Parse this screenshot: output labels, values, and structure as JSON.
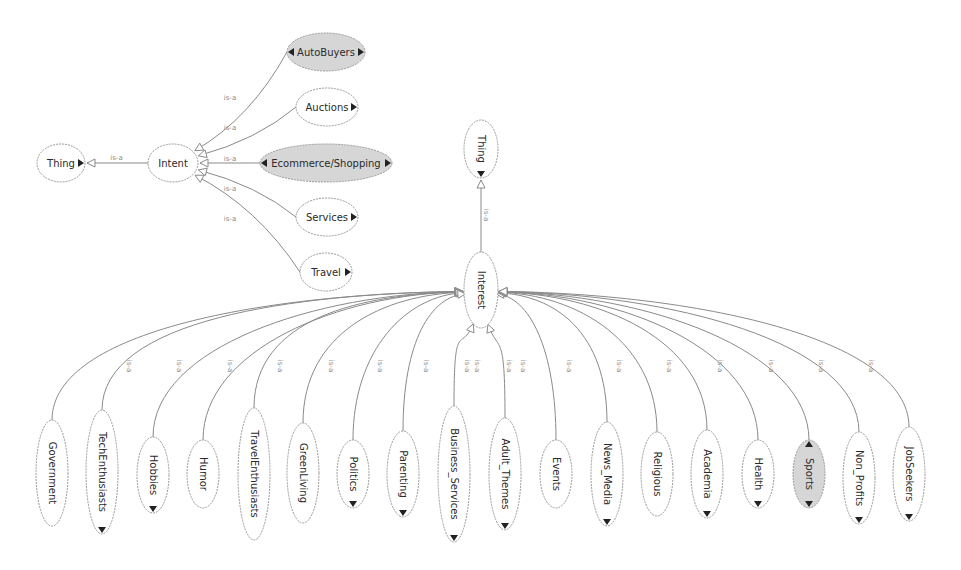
{
  "diagram": {
    "type": "ontology-graph",
    "edge_label": "is-a",
    "colors": {
      "background": "#ffffff",
      "node_fill": "#ffffff",
      "node_fill_selected": "#d6d6d6",
      "node_stroke": "#9a9a9a",
      "edge": "#8a8a8a",
      "text": "#2a2a2a"
    },
    "intent_cluster": {
      "root": {
        "label": "Thing",
        "cx": 61,
        "cy": 163,
        "rx": 24,
        "ry": 19
      },
      "parent": {
        "label": "Intent",
        "cx": 173,
        "cy": 163,
        "rx": 25,
        "ry": 19
      },
      "children": [
        {
          "label": "AutoBuyers",
          "cx": 326,
          "cy": 52,
          "rx": 39,
          "ry": 19,
          "selected": true,
          "expand_left": true,
          "expand_right": true
        },
        {
          "label": "Auctions",
          "cx": 327,
          "cy": 107,
          "rx": 31,
          "ry": 19,
          "selected": false,
          "expand_left": false,
          "expand_right": true
        },
        {
          "label": "Ecommerce/Shopping",
          "cx": 326,
          "cy": 163,
          "rx": 66,
          "ry": 19,
          "selected": true,
          "expand_left": true,
          "expand_right": true
        },
        {
          "label": "Services",
          "cx": 327,
          "cy": 217,
          "rx": 31,
          "ry": 19,
          "selected": false,
          "expand_left": false,
          "expand_right": true
        },
        {
          "label": "Travel",
          "cx": 326,
          "cy": 272,
          "rx": 26,
          "ry": 19,
          "selected": false,
          "expand_left": false,
          "expand_right": true
        }
      ]
    },
    "interest_cluster": {
      "root": {
        "label": "Thing",
        "cx": 481,
        "cy": 149,
        "rx": 17,
        "ry": 29
      },
      "parent": {
        "label": "Interest",
        "cx": 481,
        "cy": 290,
        "rx": 17,
        "ry": 38
      },
      "children": [
        {
          "label": "Government",
          "cx": 52,
          "cy": 473,
          "rx": 16,
          "ry": 53,
          "selected": false,
          "expand": false
        },
        {
          "label": "TechEnthusiasts",
          "cx": 102,
          "cy": 472,
          "rx": 16,
          "ry": 62,
          "selected": false,
          "expand": true
        },
        {
          "label": "Hobbies",
          "cx": 153,
          "cy": 475,
          "rx": 16,
          "ry": 38,
          "selected": false,
          "expand": true
        },
        {
          "label": "Humor",
          "cx": 203,
          "cy": 474,
          "rx": 16,
          "ry": 34,
          "selected": false,
          "expand": false
        },
        {
          "label": "TravelEnthusiasts",
          "cx": 254,
          "cy": 474,
          "rx": 16,
          "ry": 66,
          "selected": false,
          "expand": false
        },
        {
          "label": "GreenLiving",
          "cx": 303,
          "cy": 473,
          "rx": 16,
          "ry": 50,
          "selected": false,
          "expand": false
        },
        {
          "label": "Politics",
          "cx": 353,
          "cy": 474,
          "rx": 16,
          "ry": 34,
          "selected": false,
          "expand": true
        },
        {
          "label": "Parenting",
          "cx": 403,
          "cy": 474,
          "rx": 16,
          "ry": 43,
          "selected": false,
          "expand": true
        },
        {
          "label": "Business_Services",
          "cx": 454,
          "cy": 474,
          "rx": 16,
          "ry": 68,
          "selected": false,
          "expand": true
        },
        {
          "label": "Adult_Themes",
          "cx": 505,
          "cy": 474,
          "rx": 16,
          "ry": 56,
          "selected": false,
          "expand": true
        },
        {
          "label": "Events",
          "cx": 556,
          "cy": 474,
          "rx": 16,
          "ry": 34,
          "selected": false,
          "expand": false
        },
        {
          "label": "News_Media",
          "cx": 607,
          "cy": 474,
          "rx": 16,
          "ry": 52,
          "selected": false,
          "expand": true
        },
        {
          "label": "Religious",
          "cx": 657,
          "cy": 474,
          "rx": 16,
          "ry": 42,
          "selected": false,
          "expand": false
        },
        {
          "label": "Academia",
          "cx": 707,
          "cy": 474,
          "rx": 16,
          "ry": 44,
          "selected": false,
          "expand": true
        },
        {
          "label": "Health",
          "cx": 758,
          "cy": 474,
          "rx": 16,
          "ry": 34,
          "selected": false,
          "expand": true
        },
        {
          "label": "Sports",
          "cx": 809,
          "cy": 474,
          "rx": 16,
          "ry": 34,
          "selected": true,
          "expand": true
        },
        {
          "label": "Non_Profits",
          "cx": 859,
          "cy": 478,
          "rx": 16,
          "ry": 46,
          "selected": false,
          "expand": true
        },
        {
          "label": "JobSeekers",
          "cx": 909,
          "cy": 474,
          "rx": 16,
          "ry": 47,
          "selected": false,
          "expand": true
        }
      ]
    }
  }
}
